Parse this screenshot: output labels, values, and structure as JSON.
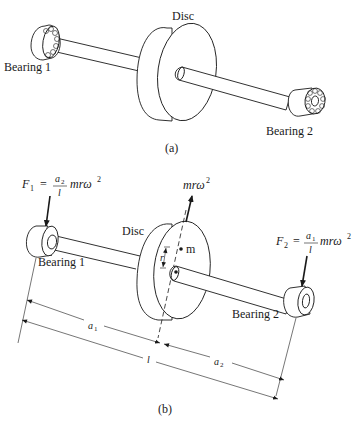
{
  "figure_a": {
    "caption": "(a)",
    "labels": {
      "disc": "Disc",
      "bearing1": "Bearing 1",
      "bearing2": "Bearing 2"
    }
  },
  "figure_b": {
    "caption": "(b)",
    "labels": {
      "disc": "Disc",
      "bearing1": "Bearing 1",
      "bearing2": "Bearing 2",
      "mass": "m",
      "radius": "r",
      "centrifugal_force": "mrω",
      "centrifugal_force_exp": "2"
    },
    "forces": {
      "f1": {
        "symbol": "F",
        "sub": "1",
        "eq": "=",
        "num": "a",
        "num_sub": "2",
        "den": "l",
        "tail": "mrω",
        "tail_exp": "2"
      },
      "f2": {
        "symbol": "F",
        "sub": "2",
        "eq": "=",
        "num": "a",
        "num_sub": "1",
        "den": "l",
        "tail": "mrω",
        "tail_exp": "2"
      }
    },
    "dimensions": {
      "a1": "a",
      "a1_sub": "1",
      "a2": "a",
      "a2_sub": "2",
      "l": "l"
    }
  }
}
